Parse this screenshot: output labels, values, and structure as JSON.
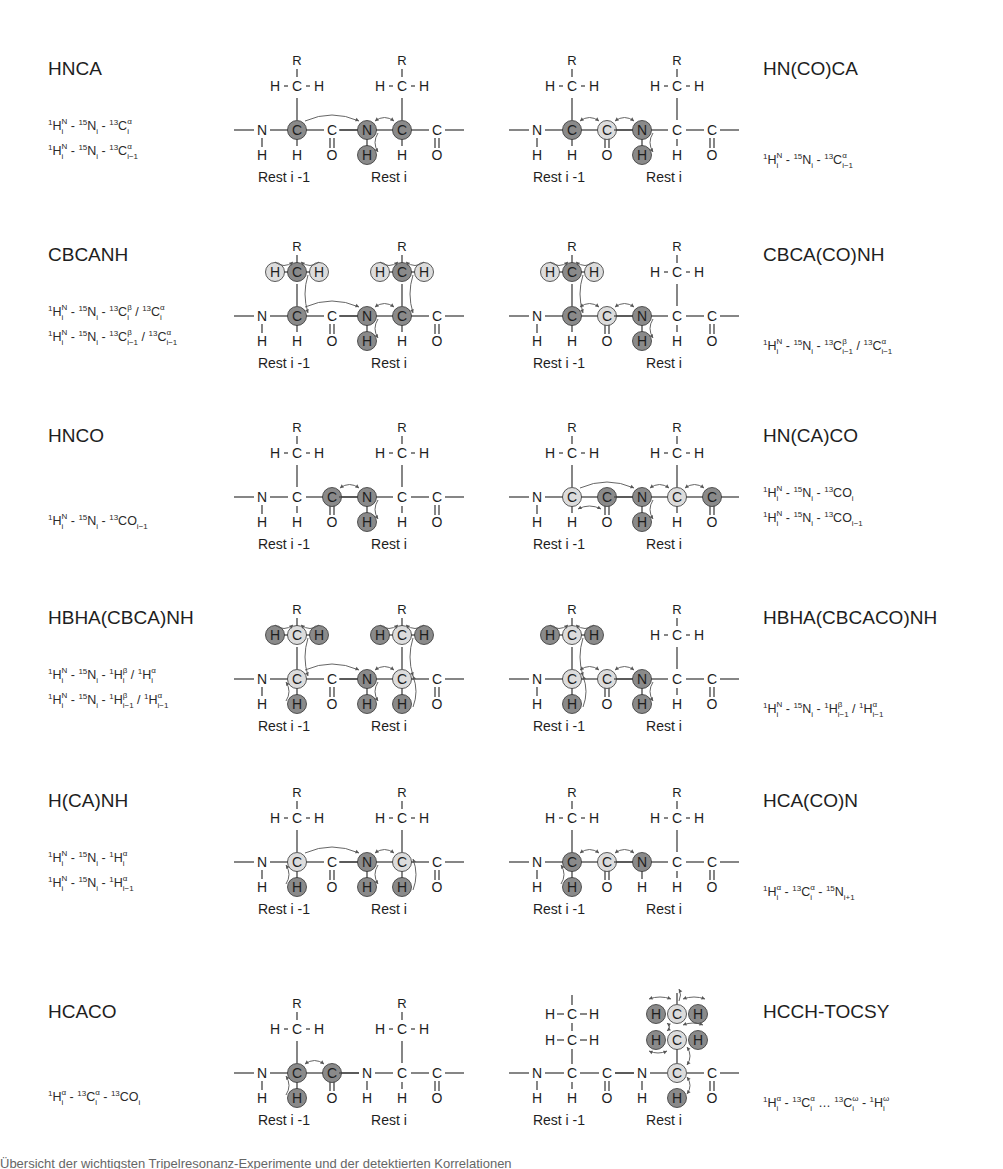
{
  "figure": {
    "colors": {
      "dark_atom": "#8a8a8a",
      "light_atom": "#dcdcdc",
      "bond": "#444444",
      "text": "#1e1e1e",
      "arrow": "#555555"
    },
    "residue_labels": {
      "prev": "Rest i -1",
      "curr": "Rest i"
    },
    "experiments": [
      {
        "name": "HNCA",
        "side": "left",
        "row": 0,
        "correlations": [
          [
            [
              "1",
              "H",
              "N",
              "i"
            ],
            [
              "15",
              "N",
              "",
              "i"
            ],
            [
              "13",
              "Cα",
              "",
              "i"
            ]
          ],
          [
            [
              "1",
              "H",
              "N",
              "i"
            ],
            [
              "15",
              "N",
              "",
              "i"
            ],
            [
              "13",
              "Cα",
              "",
              "i−1"
            ]
          ]
        ],
        "structure": {
          "hl": {
            "CA1": "dark",
            "N2": "dark",
            "HN2": "dark",
            "CA2": "dark"
          },
          "arrows": [
            [
              "CA1",
              "N2",
              "arc"
            ],
            [
              "N2",
              "CA2",
              "arc"
            ],
            [
              "N2",
              "HN2",
              "side"
            ]
          ]
        }
      },
      {
        "name": "HN(CO)CA",
        "side": "right",
        "row": 0,
        "correlations": [
          [
            [
              "1",
              "H",
              "N",
              "i"
            ],
            [
              "15",
              "N",
              "",
              "i"
            ],
            [
              "13",
              "Cα",
              "",
              "i−1"
            ]
          ]
        ],
        "structure": {
          "hl": {
            "CA1": "dark",
            "C1": "light",
            "N2": "dark",
            "HN2": "dark"
          },
          "arrows": [
            [
              "CA1",
              "C1",
              "arc"
            ],
            [
              "C1",
              "N2",
              "arc"
            ],
            [
              "N2",
              "HN2",
              "side"
            ]
          ]
        }
      },
      {
        "name": "CBCANH",
        "side": "left",
        "row": 1,
        "correlations": [
          [
            [
              "1",
              "H",
              "N",
              "i"
            ],
            [
              "15",
              "N",
              "",
              "i"
            ],
            [
              "13",
              "Cβ",
              "",
              "i"
            ],
            [
              "/13",
              "Cα",
              "",
              "i"
            ]
          ],
          [
            [
              "1",
              "H",
              "N",
              "i"
            ],
            [
              "15",
              "N",
              "",
              "i"
            ],
            [
              "13",
              "Cβ",
              "",
              "i−1"
            ],
            [
              "/13",
              "Cα",
              "",
              "i−1"
            ]
          ]
        ],
        "structure": {
          "hl": {
            "CB1": "dark",
            "HBa1": "light",
            "HBb1": "light",
            "CA1": "dark",
            "N2": "dark",
            "HN2": "dark",
            "CB2": "dark",
            "HBa2": "light",
            "HBb2": "light",
            "CA2": "dark"
          },
          "arrows": [
            [
              "HBa1",
              "CB1",
              "top"
            ],
            [
              "HBb1",
              "CB1",
              "top"
            ],
            [
              "CB1",
              "CA1",
              "side"
            ],
            [
              "CA1",
              "N2",
              "arc"
            ],
            [
              "HBa2",
              "CB2",
              "top"
            ],
            [
              "HBb2",
              "CB2",
              "top"
            ],
            [
              "CB2",
              "CA2",
              "side"
            ],
            [
              "CA2",
              "N2",
              "arc"
            ],
            [
              "N2",
              "HN2",
              "side"
            ]
          ]
        }
      },
      {
        "name": "CBCA(CO)NH",
        "side": "right",
        "row": 1,
        "correlations": [
          [
            [
              "1",
              "H",
              "N",
              "i"
            ],
            [
              "15",
              "N",
              "",
              "i"
            ],
            [
              "13",
              "Cβ",
              "",
              "i−1"
            ],
            [
              "/13",
              "Cα",
              "",
              "i−1"
            ]
          ]
        ],
        "structure": {
          "hl": {
            "CB1": "dark",
            "HBa1": "light",
            "HBb1": "light",
            "CA1": "dark",
            "C1": "light",
            "N2": "dark",
            "HN2": "dark"
          },
          "arrows": [
            [
              "HBa1",
              "CB1",
              "top"
            ],
            [
              "HBb1",
              "CB1",
              "top"
            ],
            [
              "CB1",
              "CA1",
              "side"
            ],
            [
              "CA1",
              "C1",
              "arc"
            ],
            [
              "C1",
              "N2",
              "arc"
            ],
            [
              "N2",
              "HN2",
              "side"
            ]
          ]
        }
      },
      {
        "name": "HNCO",
        "side": "left",
        "row": 2,
        "correlations": [
          [
            [
              "1",
              "H",
              "N",
              "i"
            ],
            [
              "15",
              "N",
              "",
              "i"
            ],
            [
              "13",
              "CO",
              "",
              "i−1"
            ]
          ]
        ],
        "structure": {
          "hl": {
            "C1": "dark",
            "N2": "dark",
            "HN2": "dark"
          },
          "arrows": [
            [
              "C1",
              "N2",
              "arc"
            ],
            [
              "N2",
              "HN2",
              "side"
            ]
          ]
        }
      },
      {
        "name": "HN(CA)CO",
        "side": "right",
        "row": 2,
        "correlations": [
          [
            [
              "1",
              "H",
              "N",
              "i"
            ],
            [
              "15",
              "N",
              "",
              "i"
            ],
            [
              "13",
              "CO",
              "",
              "i"
            ]
          ],
          [
            [
              "1",
              "H",
              "N",
              "i"
            ],
            [
              "15",
              "N",
              "",
              "i"
            ],
            [
              "13",
              "CO",
              "",
              "i−1"
            ]
          ]
        ],
        "structure": {
          "hl": {
            "CA1": "light",
            "C1": "dark",
            "N2": "dark",
            "HN2": "dark",
            "CA2": "light",
            "C2": "dark"
          },
          "arrows": [
            [
              "CA1",
              "N2",
              "arc"
            ],
            [
              "CA1",
              "C1",
              "under"
            ],
            [
              "N2",
              "CA2",
              "arc"
            ],
            [
              "CA2",
              "C2",
              "arc"
            ],
            [
              "N2",
              "HN2",
              "side"
            ]
          ]
        }
      },
      {
        "name": "HBHA(CBCA)NH",
        "side": "left",
        "row": 3,
        "correlations": [
          [
            [
              "1",
              "H",
              "N",
              "i"
            ],
            [
              "15",
              "N",
              "",
              "i"
            ],
            [
              "1",
              "Hβ",
              "",
              "i"
            ],
            [
              "/1",
              "Hα",
              "",
              "i"
            ]
          ],
          [
            [
              "1",
              "H",
              "N",
              "i"
            ],
            [
              "15",
              "N",
              "",
              "i"
            ],
            [
              "1",
              "Hβ",
              "",
              "i−1"
            ],
            [
              "/1",
              "Hα",
              "",
              "i−1"
            ]
          ]
        ],
        "structure": {
          "hl": {
            "CB1": "light",
            "HBa1": "dark",
            "HBb1": "dark",
            "CA1": "light",
            "HA1": "dark",
            "N2": "dark",
            "HN2": "dark",
            "CB2": "light",
            "HBa2": "dark",
            "HBb2": "dark",
            "CA2": "light",
            "HA2": "dark"
          },
          "arrows": [
            [
              "HBa1",
              "CB1",
              "top"
            ],
            [
              "HBb1",
              "CB1",
              "top"
            ],
            [
              "CB1",
              "CA1",
              "side"
            ],
            [
              "HA1",
              "CA1",
              "sideL"
            ],
            [
              "CA1",
              "N2",
              "arc"
            ],
            [
              "HBa2",
              "CB2",
              "top"
            ],
            [
              "HBb2",
              "CB2",
              "top"
            ],
            [
              "CB2",
              "CA2",
              "side"
            ],
            [
              "HA2",
              "CA2",
              "side"
            ],
            [
              "CA2",
              "N2",
              "arc"
            ],
            [
              "N2",
              "HN2",
              "side"
            ]
          ]
        }
      },
      {
        "name": "HBHA(CBCACO)NH",
        "side": "right",
        "row": 3,
        "correlations": [
          [
            [
              "1",
              "H",
              "N",
              "i"
            ],
            [
              "15",
              "N",
              "",
              "i"
            ],
            [
              "1",
              "Hβ",
              "",
              "i−1"
            ],
            [
              "/1",
              "Hα",
              "",
              "i−1"
            ]
          ]
        ],
        "structure": {
          "hl": {
            "CB1": "light",
            "HBa1": "dark",
            "HBb1": "dark",
            "CA1": "light",
            "HA1": "dark",
            "C1": "light",
            "N2": "dark",
            "HN2": "dark"
          },
          "arrows": [
            [
              "HBa1",
              "CB1",
              "top"
            ],
            [
              "HBb1",
              "CB1",
              "top"
            ],
            [
              "CB1",
              "CA1",
              "side"
            ],
            [
              "HA1",
              "CA1",
              "side"
            ],
            [
              "CA1",
              "C1",
              "arc"
            ],
            [
              "C1",
              "N2",
              "arc"
            ],
            [
              "N2",
              "HN2",
              "side"
            ]
          ]
        }
      },
      {
        "name": "H(CA)NH",
        "side": "left",
        "row": 4,
        "correlations": [
          [
            [
              "1",
              "H",
              "N",
              "i"
            ],
            [
              "15",
              "N",
              "",
              "i"
            ],
            [
              "1",
              "Hα",
              "",
              "i"
            ]
          ],
          [
            [
              "1",
              "H",
              "N",
              "i"
            ],
            [
              "15",
              "N",
              "",
              "i"
            ],
            [
              "1",
              "Hα",
              "",
              "i−1"
            ]
          ]
        ],
        "structure": {
          "hl": {
            "CA1": "light",
            "HA1": "dark",
            "N2": "dark",
            "HN2": "dark",
            "CA2": "light",
            "HA2": "dark"
          },
          "arrows": [
            [
              "HA1",
              "CA1",
              "sideL"
            ],
            [
              "CA1",
              "N2",
              "arc"
            ],
            [
              "CA2",
              "N2",
              "arc"
            ],
            [
              "HA2",
              "CA2",
              "side"
            ],
            [
              "N2",
              "HN2",
              "side"
            ]
          ]
        }
      },
      {
        "name": "HCA(CO)N",
        "side": "right",
        "row": 4,
        "correlations": [
          [
            [
              "1",
              "Hα",
              "",
              "i"
            ],
            [
              "13",
              "Cα",
              "",
              "i"
            ],
            [
              "15",
              "N",
              "",
              "i+1"
            ]
          ]
        ],
        "structure": {
          "hl": {
            "CA1": "dark",
            "HA1": "dark",
            "C1": "light",
            "N2": "dark"
          },
          "arrows": [
            [
              "HA1",
              "CA1",
              "sideL"
            ],
            [
              "CA1",
              "C1",
              "arc"
            ],
            [
              "C1",
              "N2",
              "arc"
            ]
          ]
        }
      },
      {
        "name": "HCACO",
        "side": "left",
        "row": 5,
        "correlations": [
          [
            [
              "1",
              "Hα",
              "",
              "i"
            ],
            [
              "13",
              "Cα",
              "",
              "i"
            ],
            [
              "13",
              "CO",
              "",
              "i"
            ]
          ]
        ],
        "structure": {
          "hl": {
            "CA1": "dark",
            "HA1": "dark",
            "C1": "dark"
          },
          "arrows": [
            [
              "HA1",
              "CA1",
              "sideL"
            ],
            [
              "CA1",
              "C1",
              "arc"
            ]
          ]
        }
      },
      {
        "name": "HCCH-TOCSY",
        "side": "right",
        "row": 5,
        "correlations": [
          [
            [
              "1",
              "Hα",
              "",
              "i"
            ],
            [
              "13",
              "Cα",
              "",
              "i"
            ],
            [
              "…13",
              "Cω",
              "",
              "i"
            ],
            [
              "1",
              "Hω",
              "",
              "i"
            ]
          ]
        ],
        "structure": {
          "tocsy": true
        }
      }
    ],
    "caption_partial": "Übersicht der wichtigsten Tripelresonanz-Experimente und der detektierten Korrelationen"
  }
}
